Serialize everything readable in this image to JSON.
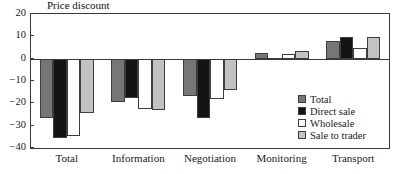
{
  "chart_data": {
    "type": "bar",
    "title": "Price discount",
    "xlabel": "",
    "ylabel": "",
    "ylim": [
      -40,
      20
    ],
    "yticks": [
      20,
      10,
      0,
      -10,
      -20,
      -30,
      -40
    ],
    "ytick_labels": [
      "20",
      "10",
      "0",
      "−10",
      "−20",
      "−30",
      "−40"
    ],
    "grid": false,
    "legend_position": "bottom-right inside plot",
    "categories": [
      "Total",
      "Information",
      "Negotiation",
      "Monitoring",
      "Transport"
    ],
    "series": [
      {
        "name": "Total",
        "color": "#767676",
        "values": [
          -26.5,
          -19.5,
          -16.5,
          2.5,
          8.0
        ]
      },
      {
        "name": "Direct sale",
        "color": "#141414",
        "values": [
          -35.5,
          -17.5,
          -26.5,
          0.5,
          9.5
        ]
      },
      {
        "name": "Wholesale",
        "color": "#ffffff",
        "values": [
          -34.5,
          -22.5,
          -18.0,
          2.0,
          5.0
        ]
      },
      {
        "name": "Sale to trader",
        "color": "#c2c2c2",
        "values": [
          -24.5,
          -23.0,
          -14.0,
          3.5,
          9.5
        ]
      }
    ]
  },
  "legend": {
    "items": [
      {
        "label": "Total"
      },
      {
        "label": "Direct sale"
      },
      {
        "label": "Wholesale"
      },
      {
        "label": "Sale to trader"
      }
    ]
  }
}
